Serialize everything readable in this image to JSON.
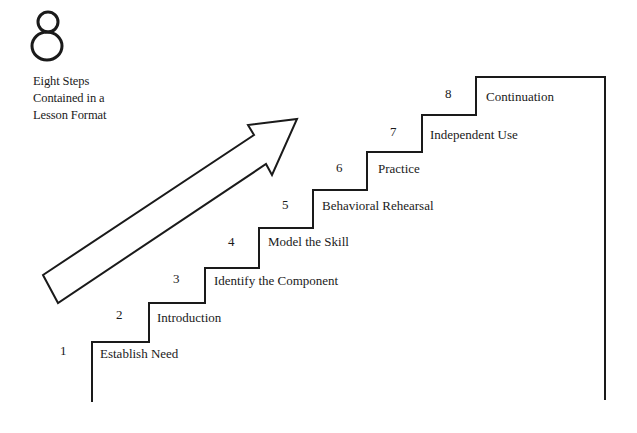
{
  "figure": {
    "number_glyph": "8",
    "caption_lines": [
      "Eight Steps",
      "Contained in a",
      "Lesson Format"
    ]
  },
  "arrow": {
    "direction": "up-right",
    "meaning": "progression"
  },
  "steps": [
    {
      "number": "1",
      "label": "Establish Need"
    },
    {
      "number": "2",
      "label": "Introduction"
    },
    {
      "number": "3",
      "label": "Identify the Component"
    },
    {
      "number": "4",
      "label": "Model the Skill"
    },
    {
      "number": "5",
      "label": "Behavioral Rehearsal"
    },
    {
      "number": "6",
      "label": "Practice"
    },
    {
      "number": "7",
      "label": "Independent Use"
    },
    {
      "number": "8",
      "label": "Continuation"
    }
  ],
  "colors": {
    "ink": "#1a1a1a",
    "background": "#ffffff"
  }
}
